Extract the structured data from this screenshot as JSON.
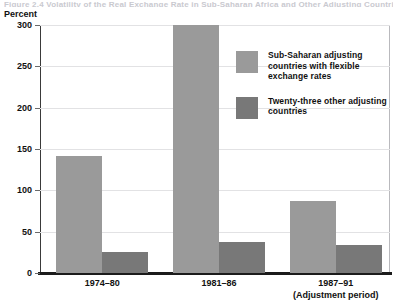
{
  "figure": {
    "title_remnant": "Figure 2.4  Volatility of the Real Exchange Rate in Sub-Saharan Africa and Other Adjusting Countries",
    "axis_unit_label": "Percent"
  },
  "chart_data": {
    "type": "bar",
    "title": "",
    "xlabel": "(Adjustment period)",
    "ylabel": "Percent",
    "ylim": [
      0,
      300
    ],
    "yticks": [
      0,
      50,
      100,
      150,
      200,
      250,
      300
    ],
    "ytick_labels": [
      "0",
      "50",
      "100",
      "150",
      "200",
      "250",
      "300"
    ],
    "grid": true,
    "legend_position": "inside-upper-right",
    "categories": [
      "1974–80",
      "1981–86",
      "1987–91"
    ],
    "category_sublabels": [
      "",
      "",
      "(Adjustment period)"
    ],
    "series": [
      {
        "name": "Sub-Saharan adjusting countries with flexible exchange rates",
        "color": "#9a9a9a",
        "values": [
          141,
          300,
          87
        ]
      },
      {
        "name": "Twenty-three other adjusting countries",
        "color": "#787878",
        "values": [
          25,
          38,
          34
        ]
      }
    ]
  },
  "legend": {
    "items": [
      {
        "label": "Sub-Saharan adjusting countries with flexible exchange rates",
        "color": "#9a9a9a"
      },
      {
        "label": "Twenty-three other adjusting countries",
        "color": "#787878"
      }
    ]
  }
}
